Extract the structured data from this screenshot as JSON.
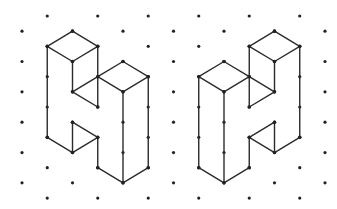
{
  "diagram": {
    "type": "isometric-dot-grid",
    "background": "#ffffff",
    "line_color": "#2b2b2b",
    "dot_color": "#222222",
    "grid": {
      "origin_x": 22,
      "origin_y": 16,
      "col_step": 25.25,
      "half_row_step": 15.17,
      "columns": 13,
      "half_rows": 13,
      "rule": "dot exists where (col + half_row) is odd"
    },
    "figures": [
      {
        "name": "left-solid",
        "description": "Isometric solid of unit cubes, mirror image of right solid",
        "edges": [
          [
            [
              2,
              1
            ],
            [
              1,
              2
            ]
          ],
          [
            [
              2,
              1
            ],
            [
              3,
              2
            ]
          ],
          [
            [
              1,
              2
            ],
            [
              2,
              3
            ]
          ],
          [
            [
              2,
              3
            ],
            [
              3,
              2
            ]
          ],
          [
            [
              1,
              2
            ],
            [
              1,
              8
            ]
          ],
          [
            [
              2,
              3
            ],
            [
              2,
              5
            ]
          ],
          [
            [
              3,
              2
            ],
            [
              3,
              6
            ]
          ],
          [
            [
              2,
              5
            ],
            [
              3,
              4
            ]
          ],
          [
            [
              2,
              5
            ],
            [
              3,
              6
            ]
          ],
          [
            [
              3,
              4
            ],
            [
              4,
              3
            ]
          ],
          [
            [
              4,
              3
            ],
            [
              5,
              4
            ]
          ],
          [
            [
              3,
              4
            ],
            [
              4,
              5
            ]
          ],
          [
            [
              4,
              5
            ],
            [
              5,
              4
            ]
          ],
          [
            [
              4,
              5
            ],
            [
              4,
              11
            ]
          ],
          [
            [
              5,
              4
            ],
            [
              5,
              10
            ]
          ],
          [
            [
              1,
              8
            ],
            [
              2,
              9
            ]
          ],
          [
            [
              2,
              7
            ],
            [
              2,
              9
            ]
          ],
          [
            [
              2,
              7
            ],
            [
              3,
              8
            ]
          ],
          [
            [
              2,
              9
            ],
            [
              3,
              8
            ]
          ],
          [
            [
              3,
              8
            ],
            [
              3,
              10
            ]
          ],
          [
            [
              3,
              10
            ],
            [
              4,
              11
            ]
          ],
          [
            [
              4,
              11
            ],
            [
              5,
              10
            ]
          ]
        ]
      },
      {
        "name": "right-solid",
        "description": "Mirror image of left solid (reflected about the middle column)",
        "mirror_of": 0,
        "mirror_col": 12
      }
    ]
  }
}
